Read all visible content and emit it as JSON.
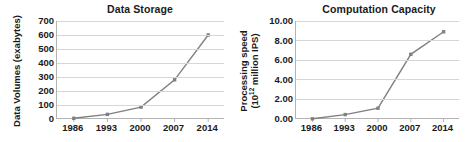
{
  "figure": {
    "background": "#ffffff",
    "series_color": "#808080",
    "grid_color": "#d6d6d6",
    "axis_color": "#b3b3b3",
    "text_color": "#1a1a1a"
  },
  "chart_data": [
    {
      "type": "line",
      "title": "Data Storage",
      "xlabel": "",
      "ylabel": "Data Volumes (exabytes)",
      "ylabel_parts": {
        "pre": "Data Volumes (exabytes)",
        "sup": "",
        "post": ""
      },
      "categories": [
        "1986",
        "1993",
        "2000",
        "2007",
        "2014"
      ],
      "values": [
        5,
        33,
        85,
        280,
        600
      ],
      "yticks": [
        0,
        100,
        200,
        300,
        400,
        500,
        600,
        700
      ],
      "ytick_labels": [
        "0",
        "100",
        "200",
        "300",
        "400",
        "500",
        "600",
        "700"
      ],
      "ylim": [
        0,
        700
      ],
      "grid": true,
      "legend": "none",
      "markers": true
    },
    {
      "type": "line",
      "title": "Computation Capacity",
      "xlabel": "",
      "ylabel": "Processing speed (10^12 million IPS)",
      "ylabel_parts": {
        "pre": "Processing speed",
        "sup": "12",
        "post": "(10"
      },
      "ylabel_line1": "Processing speed",
      "ylabel_line2_pre": "(10",
      "ylabel_line2_sup": "12",
      "ylabel_line2_post": " million IPS)",
      "categories": [
        "1986",
        "1993",
        "2000",
        "2007",
        "2014"
      ],
      "values": [
        0.02,
        0.45,
        1.1,
        6.6,
        8.9
      ],
      "yticks": [
        0,
        2,
        4,
        6,
        8,
        10
      ],
      "ytick_labels": [
        "0.00",
        "2.00",
        "4.00",
        "6.00",
        "8.00",
        "10.00"
      ],
      "ylim": [
        0,
        10
      ],
      "grid": true,
      "legend": "none",
      "markers": true
    }
  ]
}
